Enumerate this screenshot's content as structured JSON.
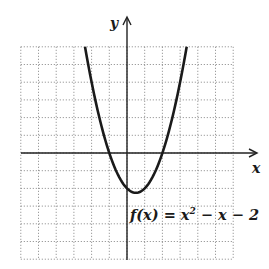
{
  "chart_data": {
    "type": "line",
    "title": "",
    "function_label": "f(x) = x² − x − 2",
    "function_label_parts": {
      "lhs": "f(x) = x",
      "exp": "2",
      "rhs": " − x − 2"
    },
    "xlabel": "x",
    "ylabel": "y",
    "xlim": [
      -6,
      6
    ],
    "ylim": [
      -6,
      6
    ],
    "grid": true,
    "grid_style": "dotted",
    "tick_labels": false,
    "series": [
      {
        "name": "f(x) = x^2 - x - 2",
        "x": [
          -2,
          -1.5,
          -1,
          -0.5,
          0,
          0.5,
          1,
          1.5,
          2,
          2.5,
          3
        ],
        "y": [
          4,
          1.75,
          0,
          -1.25,
          -2,
          -2.25,
          -2,
          -1.25,
          0,
          1.75,
          4
        ]
      }
    ],
    "annotations": {
      "vertex": [
        0.5,
        -2.25
      ],
      "x_intercepts": [
        -1,
        2
      ],
      "y_intercept": -2
    },
    "colors": {
      "curve": "#1a1a1a",
      "grid": "#777777",
      "axis": "#222222"
    }
  }
}
